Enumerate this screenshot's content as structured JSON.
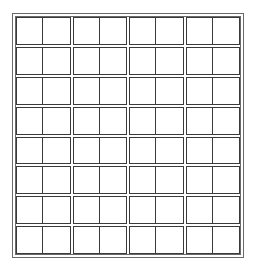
{
  "grid": {
    "rows": 8,
    "column_groups": 4,
    "cells_per_group": 2,
    "total_columns": 8,
    "line_color": "#3a3a3a",
    "frame_color": "#6a6a6a",
    "background": "#ffffff"
  }
}
